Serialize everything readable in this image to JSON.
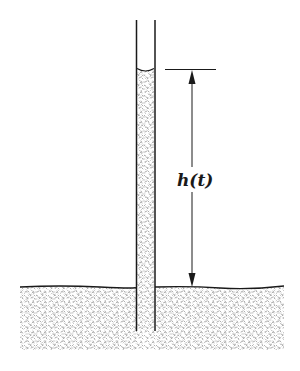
{
  "diagram": {
    "label": "h(t)",
    "label_meaning": "height of liquid column above ground surface",
    "colors": {
      "line": "#1a1a1a",
      "stipple": "#9a9a9a",
      "background": "#ffffff"
    },
    "elements": [
      "capillary tube",
      "liquid column with meniscus",
      "ground / porous medium",
      "dimension arrow"
    ]
  }
}
